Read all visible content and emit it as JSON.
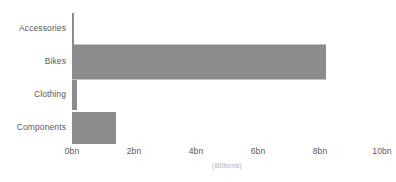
{
  "chart_data": {
    "type": "bar",
    "orientation": "horizontal",
    "title": "",
    "xlabel": "(Billions)",
    "ylabel": "",
    "categories": [
      "Accessories",
      "Bikes",
      "Clothing",
      "Components"
    ],
    "values": [
      0.07,
      8.2,
      0.17,
      1.42
    ],
    "xlim": [
      0,
      10
    ],
    "xticks": [
      0,
      2,
      4,
      6,
      8,
      10
    ],
    "xtick_labels": [
      "0bn",
      "2bn",
      "4bn",
      "6bn",
      "8bn",
      "10bn"
    ],
    "grid": false,
    "legend": false,
    "bar_color": "#8c8c8c",
    "background_color": "#ffffff",
    "label_color": "#5a5a5a",
    "axis_title_color": "#b4b4b4"
  }
}
